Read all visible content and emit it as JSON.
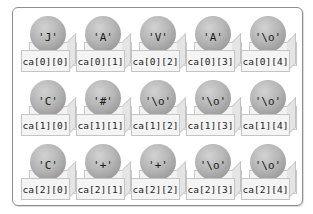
{
  "diagram": {
    "array_name": "ca",
    "rows": 3,
    "cols": 5,
    "colors": {
      "frame_border": "#8e8e8e",
      "sphere": "#b6b6b6",
      "box_face": "#f4f4f4",
      "box_border": "#c4c4c4",
      "text": "#222222"
    },
    "cells": [
      [
        {
          "value": "'J'",
          "index": "ca[0][0]"
        },
        {
          "value": "'A'",
          "index": "ca[0][1]"
        },
        {
          "value": "'V'",
          "index": "ca[0][2]"
        },
        {
          "value": "'A'",
          "index": "ca[0][3]"
        },
        {
          "value": "'\\o'",
          "index": "ca[0][4]"
        }
      ],
      [
        {
          "value": "'C'",
          "index": "ca[1][0]"
        },
        {
          "value": "'#'",
          "index": "ca[1][1]"
        },
        {
          "value": "'\\o'",
          "index": "ca[1][2]"
        },
        {
          "value": "'\\o'",
          "index": "ca[1][3]"
        },
        {
          "value": "'\\o'",
          "index": "ca[1][4]"
        }
      ],
      [
        {
          "value": "'C'",
          "index": "ca[2][0]"
        },
        {
          "value": "'+'",
          "index": "ca[2][1]"
        },
        {
          "value": "'+'",
          "index": "ca[2][2]"
        },
        {
          "value": "'\\o'",
          "index": "ca[2][3]"
        },
        {
          "value": "'\\o'",
          "index": "ca[2][4]"
        }
      ]
    ]
  }
}
